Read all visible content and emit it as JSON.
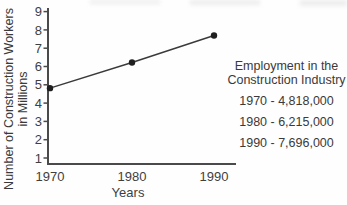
{
  "chart": {
    "y_axis_title_line1": "Number of Construction Workers",
    "y_axis_title_line2": "in Millions",
    "x_axis_title": "Years"
  },
  "legend": {
    "title_line1": "Employment in the",
    "title_line2": "Construction Industry",
    "items": [
      "1970 - 4,818,000",
      "1980 - 6,215,000",
      "1990 - 7,696,000"
    ]
  },
  "chart_data": {
    "type": "line",
    "x": [
      1970,
      1980,
      1990
    ],
    "xticks": [
      "1970",
      "1980",
      "1990"
    ],
    "values": [
      4.818,
      6.215,
      7.696
    ],
    "values_absolute": [
      4818000,
      6215000,
      7696000
    ],
    "yticks": [
      1,
      2,
      3,
      4,
      5,
      6,
      7,
      8,
      9
    ],
    "ylim": [
      0,
      9.5
    ],
    "xlabel": "Years",
    "ylabel": "Number of Construction Workers in Millions",
    "title": "Employment in the Construction Industry",
    "grid": false,
    "legend_position": "right",
    "marker": "circle",
    "colors": {
      "line": "#3a3a3a",
      "point": "#1f1f1f",
      "axis": "#4a4a4a",
      "text": "#3f3f3f"
    }
  }
}
